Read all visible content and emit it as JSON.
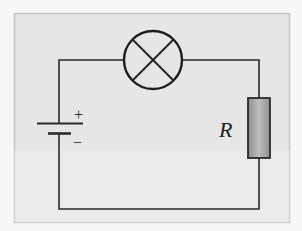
{
  "diagram": {
    "type": "circuit",
    "panel": {
      "background": "#e6e6e6",
      "border": "#c8c8c8"
    },
    "components": {
      "battery": {
        "positive_label": "+",
        "negative_label": "−"
      },
      "lamp": {
        "symbol": "circle-with-cross"
      },
      "resistor": {
        "label": "R",
        "fill": "#a8a8a8"
      }
    },
    "wire_color": "#2a2a2a"
  }
}
